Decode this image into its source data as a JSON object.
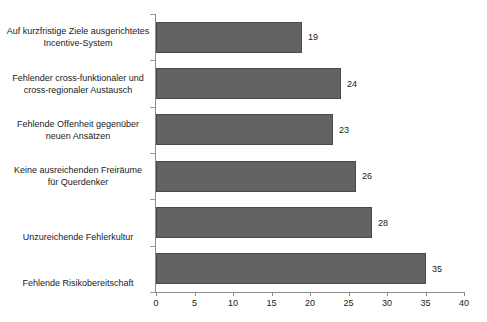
{
  "chart_data": {
    "type": "bar",
    "orientation": "horizontal",
    "title": "",
    "subtitle": "",
    "xlabel": "",
    "ylabel": "",
    "xlim": [
      0,
      40
    ],
    "xticks": [
      0,
      5,
      10,
      15,
      20,
      25,
      30,
      35,
      40
    ],
    "xtick_labels": [
      "0",
      "5",
      "10",
      "15",
      "20",
      "25",
      "30",
      "35",
      "40"
    ],
    "grid": false,
    "legend": null,
    "bar_color": "#636363",
    "bar_edge_color": "#4a4a4a",
    "axis_color": "#8c8c8c",
    "background_color": "#ffffff",
    "categories": [
      "Auf kurzfristige Ziele ausgerichtetes Incentive-System",
      "Fehlender cross-funktionaler und cross-regionaler Austausch",
      "Fehlende Offenheit gegenüber neuen Ansätzen",
      "Keine ausreichenden Freiräume für Querdenker",
      "Unzureichende Fehlerkultur",
      "Fehlende Risikobereitschaft"
    ],
    "category_lines": [
      [
        "Auf kurzfristige Ziele ausgerichtetes",
        "Incentive-System"
      ],
      [
        "Fehlender cross-funktionaler und",
        "cross-regionaler Austausch"
      ],
      [
        "Fehlende Offenheit gegenüber",
        "neuen Ansätzen"
      ],
      [
        "Keine ausreichenden Freiräume",
        "für Querdenker"
      ],
      [
        "Unzureichende Fehlerkultur"
      ],
      [
        "Fehlende Risikobereitschaft"
      ]
    ],
    "values": [
      19,
      24,
      23,
      26,
      28,
      35
    ],
    "value_labels": [
      "19",
      "24",
      "23",
      "26",
      "28",
      "35"
    ]
  }
}
